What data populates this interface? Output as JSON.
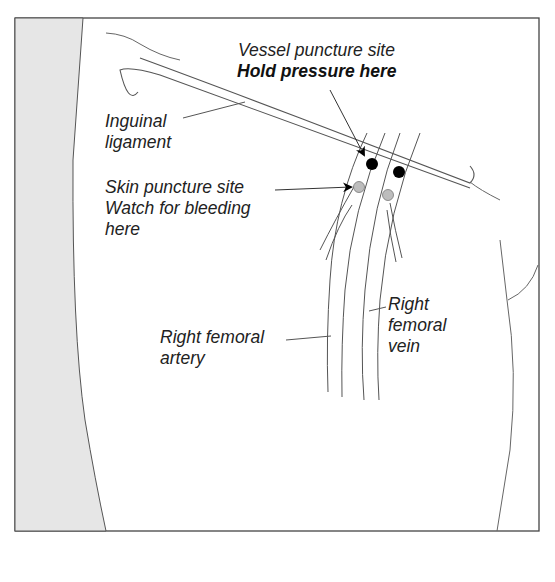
{
  "diagram": {
    "labels": {
      "vessel_puncture_line1": "Vessel puncture site",
      "vessel_puncture_line2": "Hold pressure here",
      "inguinal_line1": "Inguinal",
      "inguinal_line2": "ligament",
      "skin_puncture_line1": "Skin puncture site",
      "skin_puncture_line2": "Watch for bleeding",
      "skin_puncture_line3": "here",
      "artery_line1": "Right femoral",
      "artery_line2": "artery",
      "vein_line1": "Right",
      "vein_line2": "femoral",
      "vein_line3": "vein"
    },
    "markers": {
      "vessel_puncture_color": "#000000",
      "skin_puncture_color": "#bdbdbd"
    },
    "colors": {
      "shaded_region": "#e6e6e6",
      "stroke": "#555555"
    }
  }
}
